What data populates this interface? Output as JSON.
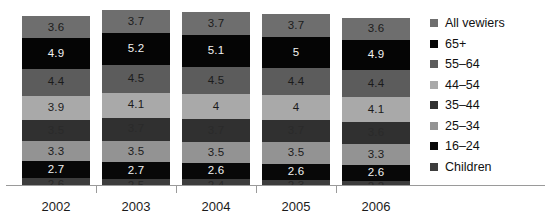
{
  "chart_data": {
    "type": "bar",
    "stacked": true,
    "title": "",
    "xlabel": "",
    "ylabel": "",
    "grid": false,
    "legend_position": "right",
    "categories": [
      "2002",
      "2003",
      "2004",
      "2005",
      "2006"
    ],
    "series_order_bottom_to_top": [
      "Children",
      "16–24",
      "25–34",
      "35–44",
      "44–54",
      "55–64",
      "65+",
      "All vewiers"
    ],
    "series": [
      {
        "name": "All vewiers",
        "color": "#6e6e6e",
        "label_color": "dark",
        "values": [
          3.6,
          3.7,
          3.7,
          3.7,
          3.6
        ]
      },
      {
        "name": "65+",
        "color": "#050505",
        "label_color": "light",
        "values": [
          4.9,
          5.2,
          5.1,
          5.0,
          4.9
        ]
      },
      {
        "name": "55–64",
        "color": "#5c5c5c",
        "label_color": "dark",
        "values": [
          4.4,
          4.5,
          4.5,
          4.4,
          4.4
        ]
      },
      {
        "name": "44–54",
        "color": "#a9a9a9",
        "label_color": "dark",
        "values": [
          3.9,
          4.1,
          4.0,
          4.0,
          4.1
        ]
      },
      {
        "name": "35–44",
        "color": "#303030",
        "label_color": "dim",
        "values": [
          3.5,
          3.7,
          3.7,
          3.7,
          3.6
        ]
      },
      {
        "name": "25–34",
        "color": "#939393",
        "label_color": "dark",
        "values": [
          3.3,
          3.5,
          3.5,
          3.5,
          3.3
        ]
      },
      {
        "name": "16–24",
        "color": "#080808",
        "label_color": "light",
        "values": [
          2.7,
          2.7,
          2.6,
          2.6,
          2.6
        ]
      },
      {
        "name": "Children",
        "color": "#3d3d3d",
        "label_color": "dim",
        "values": [
          2.6,
          2.5,
          2.4,
          2.3,
          2.2
        ]
      }
    ]
  },
  "axis": {
    "ticks": [
      "2002",
      "2003",
      "2004",
      "2005",
      "2006"
    ]
  },
  "legend": {
    "items": [
      {
        "label": "All vewiers",
        "color": "#6e6e6e"
      },
      {
        "label": "65+",
        "color": "#050505"
      },
      {
        "label": "55–64",
        "color": "#5c5c5c"
      },
      {
        "label": "44–54",
        "color": "#a9a9a9"
      },
      {
        "label": "35–44",
        "color": "#303030"
      },
      {
        "label": "25–34",
        "color": "#939393"
      },
      {
        "label": "16–24",
        "color": "#080808"
      },
      {
        "label": "Children",
        "color": "#3d3d3d"
      }
    ]
  }
}
